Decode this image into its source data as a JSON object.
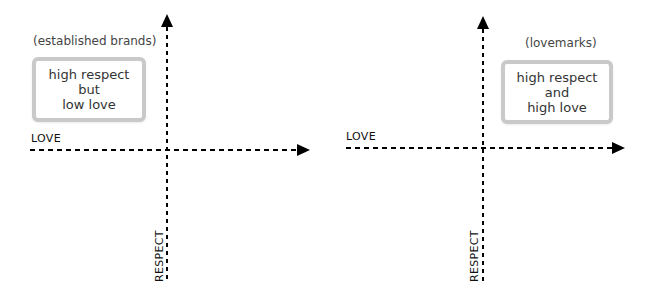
{
  "diagrams": [
    {
      "caption": "(established brands)",
      "box_lines": [
        "high respect",
        "but",
        "low love"
      ],
      "x_axis_label": "LOVE",
      "y_axis_label": "RESPECT",
      "quadrant": "top-left"
    },
    {
      "caption": "(lovemarks)",
      "box_lines": [
        "high respect",
        "and",
        "high love"
      ],
      "x_axis_label": "LOVE",
      "y_axis_label": "RESPECT",
      "quadrant": "top-right"
    }
  ],
  "colors": {
    "axis": "#000000",
    "box_border": "#c9c9c9",
    "text": "#333333"
  }
}
